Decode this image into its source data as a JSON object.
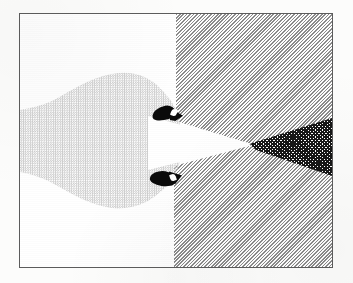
{
  "figure": {
    "title": "Halftone flow-visualization figure",
    "caption": "",
    "medium": "scanned halftone print",
    "frame": {
      "border_color": "#5c5c5c",
      "background_color": "#ffffff",
      "x": 19,
      "y": 13,
      "width": 314,
      "height": 255
    },
    "page_background_color": "#fcfcfb",
    "regions": [
      {
        "name": "white-field-left",
        "label": "White field (left)",
        "tone": "white",
        "color": "#ffffff",
        "pattern": "solid"
      },
      {
        "name": "light-body",
        "label": "Light grey leaf-shaped body",
        "tone": "light-grey",
        "color": "#cfcfcf",
        "pattern": "fine checker halftone"
      },
      {
        "name": "grey-field-right",
        "label": "Mid-grey diagonal-hatch field (right)",
        "tone": "mid-grey",
        "color": "#8c8c8c",
        "pattern": "135deg diagonal hatch"
      },
      {
        "name": "white-wedge",
        "label": "White wedge pointing right",
        "tone": "white",
        "color": "#ffffff",
        "pattern": "solid"
      },
      {
        "name": "dark-wedge",
        "label": "Dark wedge pointing left",
        "tone": "near-black",
        "color": "#171717",
        "pattern": "dense cross hatch"
      },
      {
        "name": "blob-upper",
        "label": "Upper black kernel",
        "tone": "black",
        "color": "#0a0a0a",
        "pattern": "solid"
      },
      {
        "name": "blob-lower",
        "label": "Lower black kernel",
        "tone": "black",
        "color": "#0a0a0a",
        "pattern": "solid"
      }
    ]
  }
}
